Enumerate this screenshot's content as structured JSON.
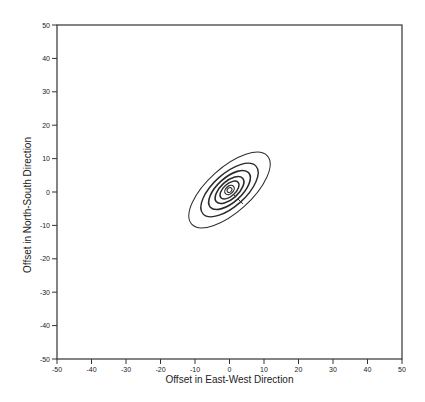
{
  "chart_data": {
    "type": "contour",
    "title": "",
    "xlabel": "Offset in East-West Direction",
    "ylabel": "Offset in North-South Direction",
    "xlim": [
      -50,
      50
    ],
    "ylim": [
      -50,
      50
    ],
    "grid": false,
    "legend": null,
    "x_ticks": [
      -50,
      -40,
      -30,
      -20,
      -10,
      0,
      10,
      20,
      30,
      40,
      50
    ],
    "y_ticks": [
      -50,
      -40,
      -30,
      -20,
      -10,
      0,
      10,
      20,
      30,
      40,
      50
    ],
    "x_tick_labels": [
      "-50",
      "-40",
      "-30",
      "-20",
      "-10",
      "0",
      "10",
      "20",
      "30",
      "40",
      "50"
    ],
    "y_tick_labels": [
      "-50",
      "-40",
      "-30",
      "-20",
      "-10",
      "0",
      "10",
      "20",
      "30",
      "40",
      "50"
    ],
    "contours": {
      "center": [
        0,
        0
      ],
      "orientation_deg": 42,
      "description": "Concentric tilted ellipses centered near origin, major axis oriented from lower-left to upper-right",
      "levels": [
        {
          "level": 1,
          "semi_major": 15.0,
          "semi_minor": 6.5,
          "stroke_width": 1.0
        },
        {
          "level": 2,
          "semi_major": 10.5,
          "semi_minor": 4.8,
          "stroke_width": 1.4
        },
        {
          "level": 3,
          "semi_major": 7.6,
          "semi_minor": 3.6,
          "stroke_width": 1.6
        },
        {
          "level": 4,
          "semi_major": 5.2,
          "semi_minor": 2.6,
          "stroke_width": 1.6
        },
        {
          "level": 5,
          "semi_major": 3.4,
          "semi_minor": 1.8,
          "stroke_width": 1.4
        },
        {
          "level": 6,
          "semi_major": 1.6,
          "semi_minor": 1.1,
          "stroke_width": 1.2
        },
        {
          "level": 7,
          "semi_major": 0.8,
          "semi_minor": 0.6,
          "stroke_width": 1.0
        }
      ]
    }
  }
}
